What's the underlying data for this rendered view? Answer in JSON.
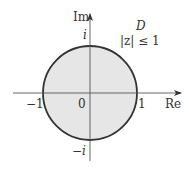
{
  "diagram": {
    "type": "complex-plane-unit-disk",
    "axes": {
      "real_label": "Re",
      "imag_label": "Im"
    },
    "ticks": {
      "neg_one": "−1",
      "origin": "0",
      "one": "1",
      "i": "i",
      "neg_i": "−i"
    },
    "region": {
      "name": "D",
      "condition": "|z| ≤ 1",
      "fill_color": "#e6e6e6",
      "boundary_color": "#333333"
    }
  }
}
